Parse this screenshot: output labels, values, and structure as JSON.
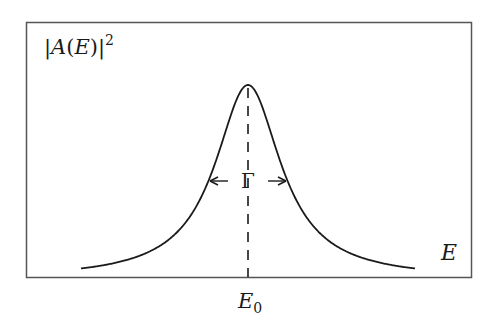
{
  "figure": {
    "type": "Lorentzian resonance line shape",
    "y_axis_label": {
      "prefix": "|",
      "var": "A",
      "open": "(",
      "arg": "E",
      "close": ")|",
      "sup": "2"
    },
    "x_axis_label": "E",
    "center_label": {
      "base": "E",
      "sub": "0"
    },
    "width_label": "Γ",
    "colors": {
      "line": "#1a1a1a",
      "frame": "#555555",
      "background": "#ffffff"
    }
  },
  "chart_data": {
    "type": "line",
    "title": "",
    "xlabel": "E",
    "ylabel": "|A(E)|^2",
    "annotations": [
      "E_0 (peak center, dashed vertical line)",
      "Γ (full width at half maximum, double arrow)"
    ],
    "function": "Lorentzian: 1 / (1 + ((E - E0)/(Γ/2))^2)",
    "x": [
      -4.2,
      -3,
      -2,
      -1.5,
      -1,
      -0.5,
      0,
      0.5,
      1,
      1.5,
      2,
      3,
      4.2
    ],
    "values": [
      0.054,
      0.1,
      0.2,
      0.31,
      0.5,
      0.8,
      1.0,
      0.8,
      0.5,
      0.31,
      0.2,
      0.1,
      0.054
    ],
    "x_units": "half-widths (Γ/2) from E0",
    "grid": false,
    "legend": null
  }
}
